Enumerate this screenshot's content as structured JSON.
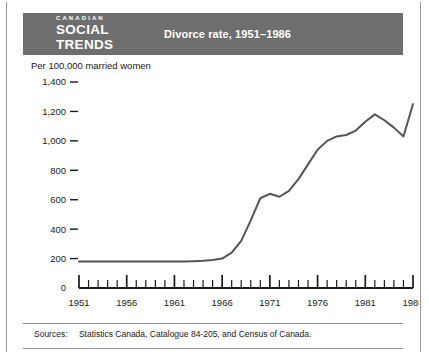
{
  "header": {
    "logo_line1": "CANADIAN",
    "logo_line2": "SOCIAL",
    "logo_line3": "TRENDS",
    "title": "Divorce rate, 1951–1986",
    "bar_color": "#6e6e6e",
    "text_color": "#ffffff"
  },
  "footer": {
    "sources_label": "Sources:",
    "sources_text": "Statistics Canada, Catalogue 84-205, and Census of Canada."
  },
  "chart_data": {
    "type": "line",
    "title": "Divorce rate, 1951–1986",
    "xlabel": "",
    "ylabel": "Per 100,000 married women",
    "ylim": [
      0,
      1400
    ],
    "xlim": [
      1951,
      1986
    ],
    "grid": false,
    "legend": null,
    "line_color": "#555555",
    "y_ticks": [
      0,
      200,
      400,
      600,
      800,
      1000,
      1200,
      1400
    ],
    "y_tick_labels": [
      "0",
      "200",
      "400",
      "600",
      "800",
      "1,000",
      "1,200",
      "1,400"
    ],
    "x_ticks": [
      1951,
      1956,
      1961,
      1966,
      1971,
      1976,
      1981,
      1986
    ],
    "x_tick_labels": [
      "1951",
      "1956",
      "1961",
      "1966",
      "1971",
      "1976",
      "1981",
      "1986"
    ],
    "x_minor_tick_interval": 1,
    "x": [
      1951,
      1952,
      1953,
      1954,
      1955,
      1956,
      1957,
      1958,
      1959,
      1960,
      1961,
      1962,
      1963,
      1964,
      1965,
      1966,
      1967,
      1968,
      1969,
      1970,
      1971,
      1972,
      1973,
      1974,
      1975,
      1976,
      1977,
      1978,
      1979,
      1980,
      1981,
      1982,
      1983,
      1984,
      1985,
      1986
    ],
    "values": [
      180,
      180,
      180,
      180,
      180,
      180,
      180,
      180,
      180,
      180,
      180,
      180,
      182,
      185,
      190,
      200,
      240,
      320,
      460,
      610,
      640,
      620,
      660,
      740,
      840,
      940,
      1000,
      1030,
      1040,
      1070,
      1130,
      1180,
      1140,
      1090,
      1030,
      1250
    ]
  }
}
